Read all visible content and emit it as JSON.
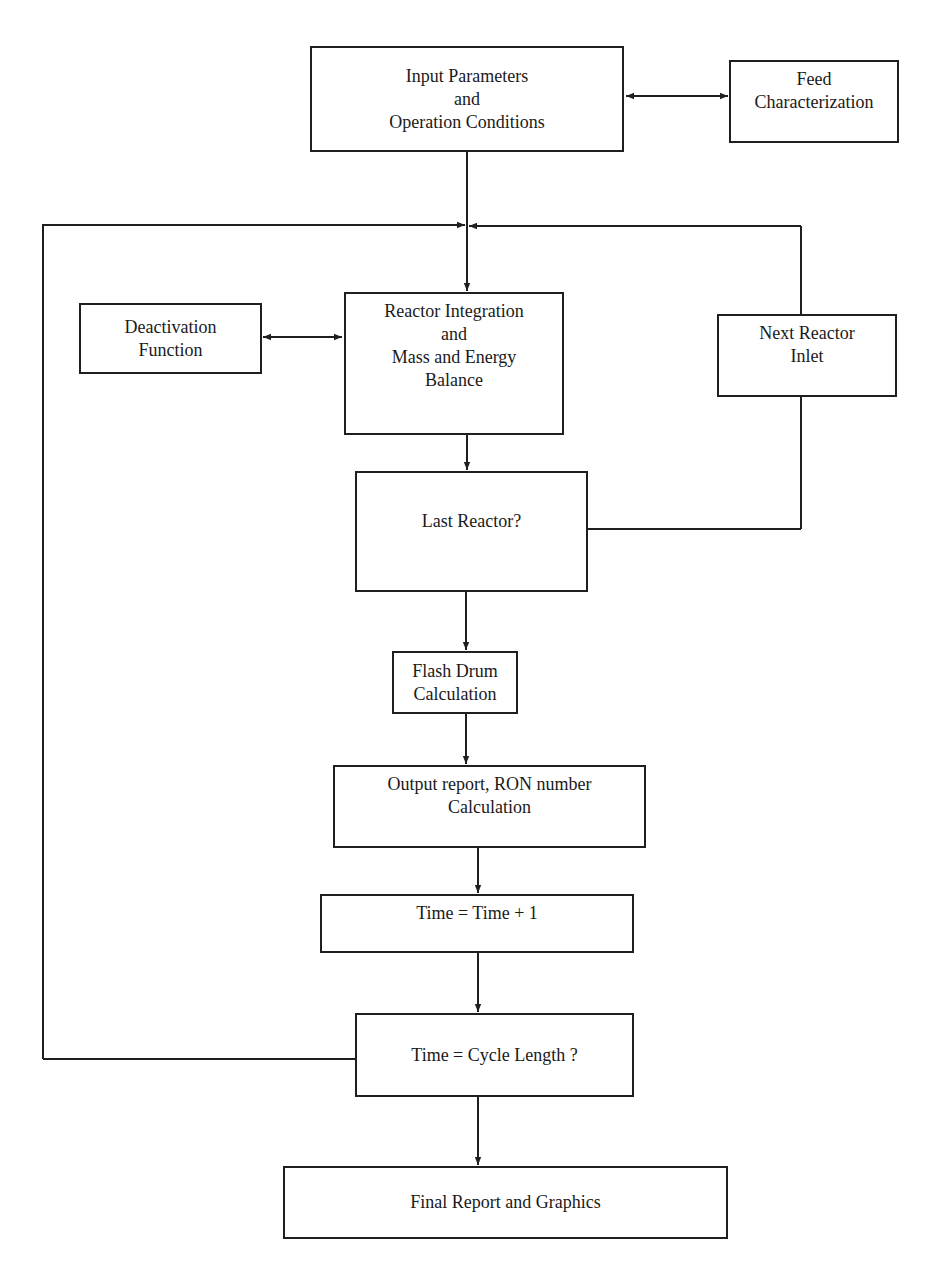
{
  "diagram": {
    "colors": {
      "line": "#1f1f1f",
      "text": "#1a1a1a",
      "background": "#ffffff"
    },
    "nodes": {
      "input": {
        "lines": [
          "Input Parameters",
          "and",
          "Operation Conditions"
        ]
      },
      "feed": {
        "lines": [
          "Feed",
          "Characterization"
        ]
      },
      "deactivation": {
        "lines": [
          "Deactivation",
          "Function"
        ]
      },
      "reactor": {
        "lines": [
          "Reactor Integration",
          "and",
          "Mass and Energy",
          "Balance"
        ]
      },
      "next_inlet": {
        "lines": [
          "Next Reactor",
          "Inlet"
        ]
      },
      "last_reactor": {
        "lines": [
          "Last Reactor?"
        ]
      },
      "flash_drum": {
        "lines": [
          "Flash Drum",
          "Calculation"
        ]
      },
      "output_report": {
        "lines": [
          "Output report, RON number",
          "Calculation"
        ]
      },
      "time_increment": {
        "lines": [
          "Time = Time + 1"
        ]
      },
      "cycle_check": {
        "lines": [
          "Time = Cycle Length ?"
        ]
      },
      "final_report": {
        "lines": [
          "Final Report and Graphics"
        ]
      }
    },
    "edges": [
      {
        "from": "input",
        "to": "feed",
        "type": "bidirectional"
      },
      {
        "from": "input",
        "to": "reactor",
        "type": "arrow"
      },
      {
        "from": "deactivation",
        "to": "reactor",
        "type": "bidirectional"
      },
      {
        "from": "reactor",
        "to": "last_reactor",
        "type": "arrow"
      },
      {
        "from": "last_reactor",
        "to": "next_inlet",
        "label": "No",
        "type": "line"
      },
      {
        "from": "next_inlet",
        "to": "reactor",
        "type": "loop-arrow"
      },
      {
        "from": "last_reactor",
        "to": "flash_drum",
        "type": "arrow"
      },
      {
        "from": "flash_drum",
        "to": "output_report",
        "type": "arrow"
      },
      {
        "from": "output_report",
        "to": "time_increment",
        "type": "arrow"
      },
      {
        "from": "time_increment",
        "to": "cycle_check",
        "type": "arrow"
      },
      {
        "from": "cycle_check",
        "to": "reactor",
        "type": "loop-arrow"
      },
      {
        "from": "cycle_check",
        "to": "final_report",
        "type": "arrow"
      }
    ]
  }
}
